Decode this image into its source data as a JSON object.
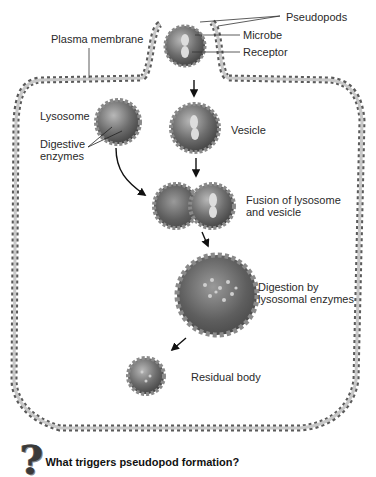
{
  "labels": {
    "pseudopods": "Pseudopods",
    "microbe": "Microbe",
    "receptor": "Receptor",
    "plasma_membrane": "Plasma membrane",
    "lysosome": "Lysosome",
    "digestive_enzymes_1": "Digestive",
    "digestive_enzymes_2": "enzymes",
    "vesicle": "Vesicle",
    "fusion_1": "Fusion of lysosome",
    "fusion_2": "and vesicle",
    "digestion_1": "Digestion by",
    "digestion_2": "lysosomal enzymes",
    "residual_body": "Residual body"
  },
  "question": {
    "icon": "question-mark-icon",
    "glyph": "?",
    "text": "What triggers pseudopod formation?"
  },
  "colors": {
    "membrane": "#9a9a9a",
    "membrane_dark": "#555555",
    "vesicle_fill": "#6b6b6b",
    "background": "#ffffff"
  }
}
